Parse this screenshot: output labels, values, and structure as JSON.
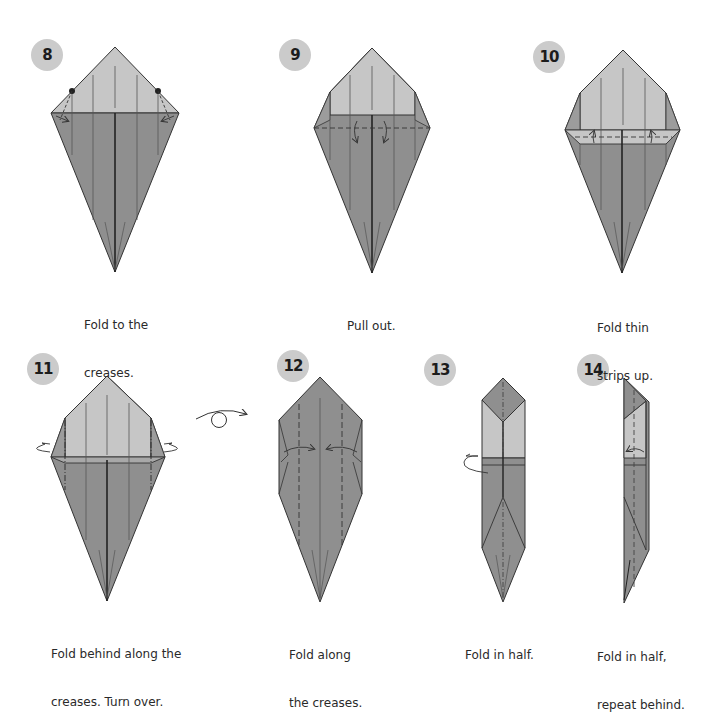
{
  "colors": {
    "paper_dark": "#8c8c8c",
    "paper_mid": "#9a9a9a",
    "paper_light": "#c6c6c6",
    "badge_bg": "#cbcbcb",
    "line": "#333333",
    "text": "#2a2a2a"
  },
  "steps": [
    {
      "number": "8",
      "caption_line1": "Fold to the",
      "caption_line2": "creases."
    },
    {
      "number": "9",
      "caption_line1": "Pull out.",
      "caption_line2": ""
    },
    {
      "number": "10",
      "caption_line1": "Fold thin",
      "caption_line2": "strips up."
    },
    {
      "number": "11",
      "caption_line1": "Fold behind along the",
      "caption_line2": "creases. Turn over."
    },
    {
      "number": "12",
      "caption_line1": "Fold along",
      "caption_line2": "the creases."
    },
    {
      "number": "13",
      "caption_line1": "Fold in half.",
      "caption_line2": ""
    },
    {
      "number": "14",
      "caption_line1": "Fold in half,",
      "caption_line2": "repeat behind."
    }
  ],
  "symbols": {
    "turn_over": "turn-over-symbol"
  }
}
